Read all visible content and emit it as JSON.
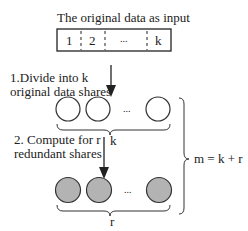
{
  "title": "The original data as input",
  "input_cells": [
    "1",
    "2",
    "...",
    "k"
  ],
  "step1": {
    "line1": "1.Divide into k",
    "line2": "original data shares"
  },
  "step2": {
    "line1": "2. Compute for r",
    "line2": "redundant shares"
  },
  "original_group": {
    "label": "k",
    "ellipsis": "...",
    "fill": "#ffffff"
  },
  "redundant_group": {
    "label": "r",
    "ellipsis": "...",
    "fill": "#b3b3b3"
  },
  "total_label": "m = k + r"
}
